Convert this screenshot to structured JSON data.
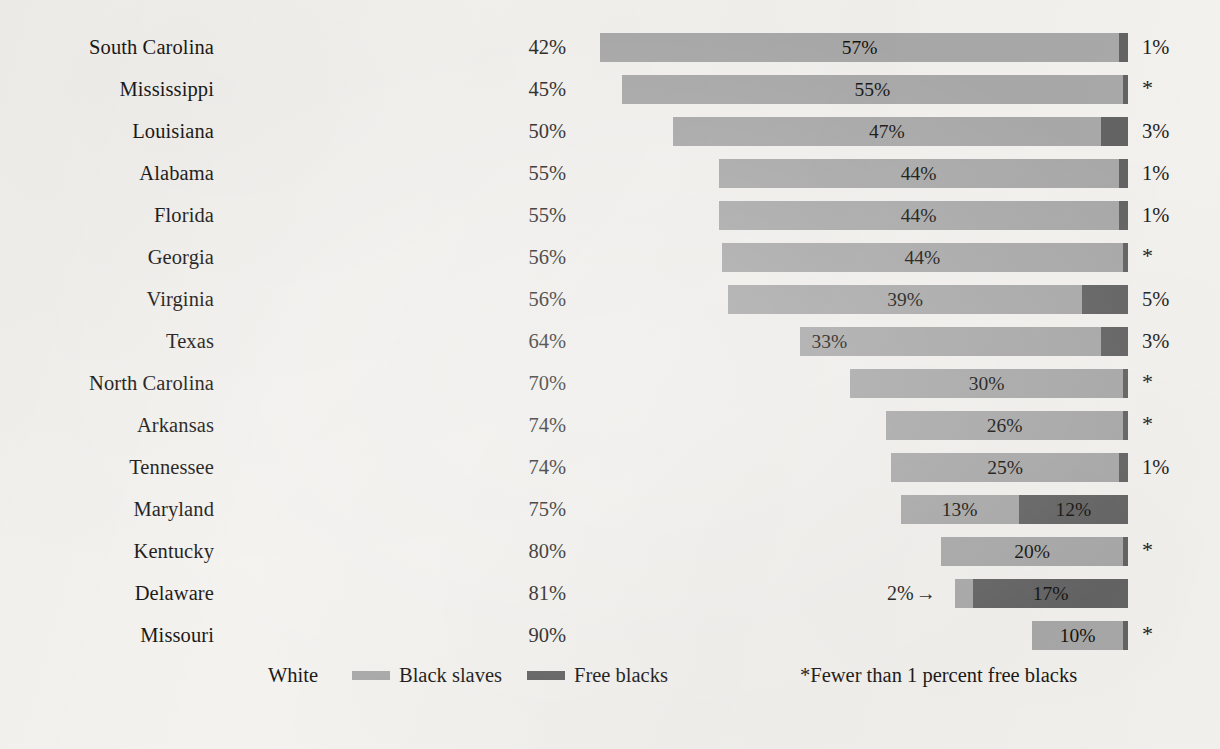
{
  "chart_data": {
    "type": "bar",
    "subtype": "stacked-horizontal-right-aligned",
    "title": "",
    "xlabel": "",
    "ylabel": "",
    "xlim": [
      0,
      100
    ],
    "grid": false,
    "legend_position": "bottom-left",
    "categories": [
      "South Carolina",
      "Mississippi",
      "Louisiana",
      "Alabama",
      "Florida",
      "Georgia",
      "Virginia",
      "Texas",
      "North Carolina",
      "Arkansas",
      "Tennessee",
      "Maryland",
      "Kentucky",
      "Delaware",
      "Missouri"
    ],
    "series": [
      {
        "name": "White",
        "color": "#ffffff",
        "values": [
          42,
          45,
          50,
          55,
          55,
          56,
          56,
          64,
          70,
          74,
          74,
          75,
          80,
          81,
          90
        ]
      },
      {
        "name": "Black slaves",
        "color": "#a9a9a9",
        "values": [
          57,
          55,
          47,
          44,
          44,
          44,
          39,
          33,
          30,
          26,
          25,
          13,
          20,
          2,
          10
        ]
      },
      {
        "name": "Free blacks",
        "color": "#646464",
        "values": [
          1,
          0.5,
          3,
          1,
          1,
          0.5,
          5,
          3,
          0.5,
          0.5,
          1,
          12,
          0.5,
          17,
          0.5
        ]
      }
    ],
    "rows": [
      {
        "state": "South Carolina",
        "white_label": "42%",
        "slaves_label": "57%",
        "slaves_value": 57,
        "free_label": "1%",
        "free_value": 1,
        "free_note": "1%",
        "slaves_label_align": "center"
      },
      {
        "state": "Mississippi",
        "white_label": "45%",
        "slaves_label": "55%",
        "slaves_value": 55,
        "free_label": "",
        "free_value": 0.6,
        "free_note": "*",
        "slaves_label_align": "center"
      },
      {
        "state": "Louisiana",
        "white_label": "50%",
        "slaves_label": "47%",
        "slaves_value": 47,
        "free_label": "3%",
        "free_value": 3,
        "free_note": "3%",
        "slaves_label_align": "center"
      },
      {
        "state": "Alabama",
        "white_label": "55%",
        "slaves_label": "44%",
        "slaves_value": 44,
        "free_label": "1%",
        "free_value": 1,
        "free_note": "1%",
        "slaves_label_align": "center"
      },
      {
        "state": "Florida",
        "white_label": "55%",
        "slaves_label": "44%",
        "slaves_value": 44,
        "free_label": "1%",
        "free_value": 1,
        "free_note": "1%",
        "slaves_label_align": "center"
      },
      {
        "state": "Georgia",
        "white_label": "56%",
        "slaves_label": "44%",
        "slaves_value": 44,
        "free_label": "",
        "free_value": 0.6,
        "free_note": "*",
        "slaves_label_align": "center"
      },
      {
        "state": "Virginia",
        "white_label": "56%",
        "slaves_label": "39%",
        "slaves_value": 39,
        "free_label": "5%",
        "free_value": 5,
        "free_note": "5%",
        "slaves_label_align": "center"
      },
      {
        "state": "Texas",
        "white_label": "64%",
        "slaves_label": "33%",
        "slaves_value": 33,
        "free_label": "3%",
        "free_value": 3,
        "free_note": "3%",
        "slaves_label_align": "left"
      },
      {
        "state": "North Carolina",
        "white_label": "70%",
        "slaves_label": "30%",
        "slaves_value": 30,
        "free_label": "",
        "free_value": 0.4,
        "free_note": "*",
        "slaves_label_align": "center"
      },
      {
        "state": "Arkansas",
        "white_label": "74%",
        "slaves_label": "26%",
        "slaves_value": 26,
        "free_label": "",
        "free_value": 0.3,
        "free_note": "*",
        "slaves_label_align": "center"
      },
      {
        "state": "Tennessee",
        "white_label": "74%",
        "slaves_label": "25%",
        "slaves_value": 25,
        "free_label": "1%",
        "free_value": 1,
        "free_note": "1%",
        "slaves_label_align": "center"
      },
      {
        "state": "Maryland",
        "white_label": "75%",
        "slaves_label": "13%",
        "slaves_value": 13,
        "free_label": "12%",
        "free_value": 12,
        "free_note": "",
        "slaves_label_align": "center"
      },
      {
        "state": "Kentucky",
        "white_label": "80%",
        "slaves_label": "20%",
        "slaves_value": 20,
        "free_label": "",
        "free_value": 0.4,
        "free_note": "*",
        "slaves_label_align": "center"
      },
      {
        "state": "Delaware",
        "white_label": "81%",
        "slaves_label": "",
        "slaves_value": 2,
        "free_label": "17%",
        "free_value": 17,
        "free_note": "",
        "slaves_label_align": "center",
        "callout": "2%",
        "callout_arrow": "→"
      },
      {
        "state": "Missouri",
        "white_label": "90%",
        "slaves_label": "10%",
        "slaves_value": 10,
        "free_label": "",
        "free_value": 0.5,
        "free_note": "*",
        "slaves_label_align": "center"
      }
    ],
    "legend": [
      {
        "label": "White",
        "swatch": "white"
      },
      {
        "label": "Black slaves",
        "swatch": "slaves"
      },
      {
        "label": "Free blacks",
        "swatch": "free"
      }
    ],
    "footnote": "*Fewer than 1 percent free blacks",
    "colors": {
      "background": "#f3f2ef",
      "white_segment": "#ffffff",
      "slaves_segment": "#a9a9a9",
      "free_segment": "#646464",
      "text": "#1b1917"
    }
  }
}
